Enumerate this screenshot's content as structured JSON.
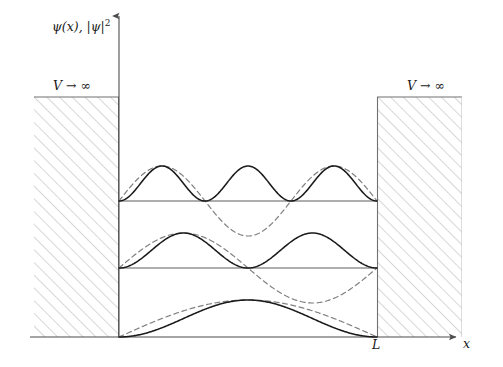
{
  "figure": {
    "labels": {
      "y_axis": "ψ(x), |ψ|²",
      "y_axis_psi": "ψ",
      "y_axis_of_x": "(x), |",
      "y_axis_psi2": "ψ",
      "y_axis_sq": "|2",
      "barrier_left": "V → ∞",
      "barrier_right": "V → ∞",
      "well_width": "L",
      "x_axis": "x"
    },
    "colors": {
      "axis": "#4d4d4d",
      "solid_curve": "#1a1a1a",
      "dashed_curve": "#808080",
      "baseline": "#666666",
      "hatch": "#b3b3b3",
      "barrier_border": "#808080",
      "background": "#ffffff"
    },
    "geometry": {
      "x_axis_y": 337,
      "y_axis_x": 119,
      "well_left_x": 119,
      "well_right_x": 377,
      "barrier_top_y": 97,
      "barrier_left_x": 34,
      "barrier_right_end_x": 462,
      "y_axis_top_y": 14,
      "x_axis_right_x": 458
    }
  },
  "chart_data": {
    "type": "line",
    "xlabel": "x",
    "ylabel": "ψ(x), |ψ|²",
    "xlim": [
      0,
      1
    ],
    "x_ticks": [
      {
        "value": 1,
        "label": "L"
      }
    ],
    "grid": false,
    "legend": null,
    "annotations": [
      {
        "text": "V → ∞",
        "region": "left barrier",
        "x": -0.33
      },
      {
        "text": "V → ∞",
        "region": "right barrier",
        "x": 1.33
      }
    ],
    "regions": [
      {
        "name": "left-infinite-barrier",
        "x_from": -0.33,
        "x_to": 0.0,
        "fill": "hatched"
      },
      {
        "name": "right-infinite-barrier",
        "x_from": 1.0,
        "x_to": 1.33,
        "fill": "hatched"
      }
    ],
    "series": [
      {
        "name": "psi_n1",
        "style": "dashed",
        "n": 1,
        "baseline_px": 337,
        "amplitude_px": 37,
        "form": "A*sin(1*pi*x/L)",
        "nodes": 0
      },
      {
        "name": "psi2_n1",
        "style": "solid",
        "n": 1,
        "baseline_px": 337,
        "amplitude_px": 37,
        "form": "A*sin^2(1*pi*x/L)",
        "nodes": 0
      },
      {
        "name": "psi_n2",
        "style": "dashed",
        "n": 2,
        "baseline_px": 268,
        "amplitude_px": 35,
        "form": "A*sin(2*pi*x/L)",
        "nodes": 1
      },
      {
        "name": "psi2_n2",
        "style": "solid",
        "n": 2,
        "baseline_px": 268,
        "amplitude_px": 35,
        "form": "A*sin^2(2*pi*x/L)",
        "nodes": 1
      },
      {
        "name": "psi_n3",
        "style": "dashed",
        "n": 3,
        "baseline_px": 201,
        "amplitude_px": 35,
        "form": "A*sin(3*pi*x/L)",
        "nodes": 2
      },
      {
        "name": "psi2_n3",
        "style": "solid",
        "n": 3,
        "baseline_px": 201,
        "amplitude_px": 35,
        "form": "A*sin^2(3*pi*x/L)",
        "nodes": 2
      }
    ],
    "energy_levels": [
      {
        "n": 1,
        "baseline_px": 337
      },
      {
        "n": 2,
        "baseline_px": 268
      },
      {
        "n": 3,
        "baseline_px": 201
      }
    ]
  }
}
